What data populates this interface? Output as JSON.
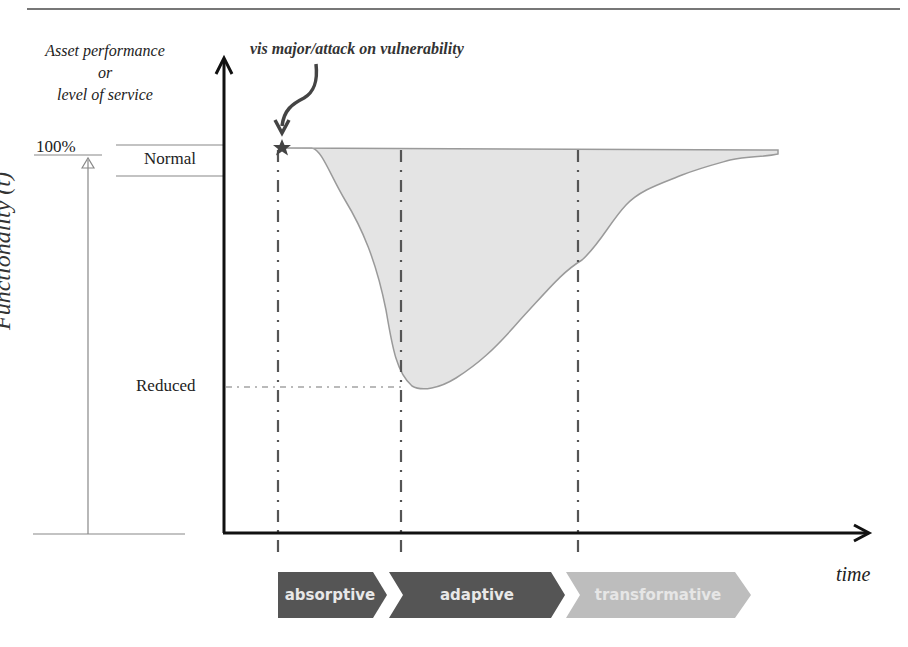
{
  "diagram": {
    "y_axis_top_label": [
      "Asset performance",
      "or",
      "level of service"
    ],
    "event_label": "vis major/attack  on vulnerability",
    "y_axis_side_label": "Functionality (t)",
    "level_100": "100%",
    "level_normal": "Normal",
    "level_reduced": "Reduced",
    "x_axis_label": "time",
    "phases": [
      {
        "label": "absorptive",
        "color": "#555555",
        "text_color": "#e8e8e8"
      },
      {
        "label": "adaptive",
        "color": "#555555",
        "text_color": "#e8e8e8"
      },
      {
        "label": "transformative",
        "color": "#bdbdbd",
        "text_color": "#e6e6e6"
      }
    ],
    "colors": {
      "axis": "#111111",
      "curve_fill": "#e4e4e4",
      "curve_stroke": "#9a9a9a",
      "dashdot": "#555555",
      "arrow": "#444444"
    }
  }
}
